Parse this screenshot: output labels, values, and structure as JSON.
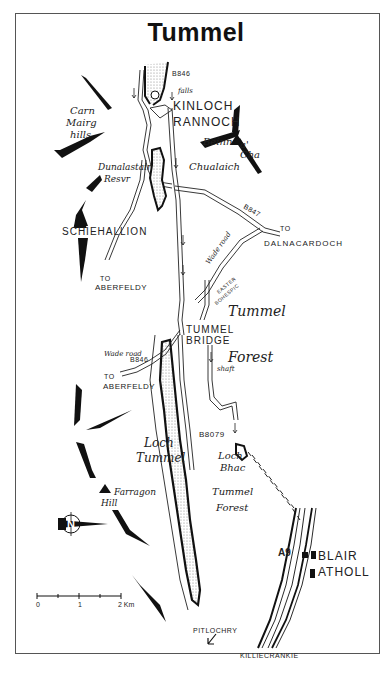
{
  "map": {
    "title": "Tummel",
    "places": {
      "kinloch": "KINLOCH",
      "rannoch": "RANNOCH",
      "schiehallion": "SCHIEHALLION",
      "dalnacardoch": "DALNACARDOCH",
      "aberfeldy_north": "ABERFELDY",
      "aberfeldy_south": "ABERFELDY",
      "tummel": "TUMMEL",
      "bridge": "BRIDGE",
      "blair": "BLAIR",
      "atholl": "ATHOLL",
      "pitlochry": "PITLOCHRY",
      "killiecrankie": "KILLIECRANKIE"
    },
    "features": {
      "carn": "Carn",
      "mairg": "Mairg",
      "hills": "hills",
      "beinn": "Beinn",
      "a": "a'",
      "cha": "Cha",
      "chualaich": "Chualaich",
      "dunalastair": "Dunalastair",
      "resvr": "Resvr",
      "tummel_forest_top": "Tummel",
      "forest_top": "Forest",
      "loch_tummel_1": "Loch",
      "loch_tummel_2": "Tummel",
      "loch_bhac_1": "Loch",
      "loch_bhac_2": "Bhac",
      "tummel_forest_bottom_1": "Tummel",
      "tummel_forest_bottom_2": "Forest",
      "farragon": "Farragon",
      "hill": "Hill",
      "falls": "falls",
      "shaft": "shaft",
      "wade_road_north": "Wade road",
      "wade_road_south": "Wade road",
      "easter_bohespic_1": "EASTER",
      "easter_bohespic_2": "BOHESPIC"
    },
    "roads": {
      "b846_north": "B846",
      "b847": "B847",
      "b846_south": "B846",
      "b8079": "B8079",
      "a9": "A9"
    },
    "directions": {
      "to_dalnacardoch": "TO",
      "to_aberfeldy_north": "TO",
      "to_aberfeldy_south": "TO"
    },
    "scale": {
      "ticks": [
        "0",
        "1",
        "2 Km"
      ]
    },
    "north_arrow": "N"
  }
}
